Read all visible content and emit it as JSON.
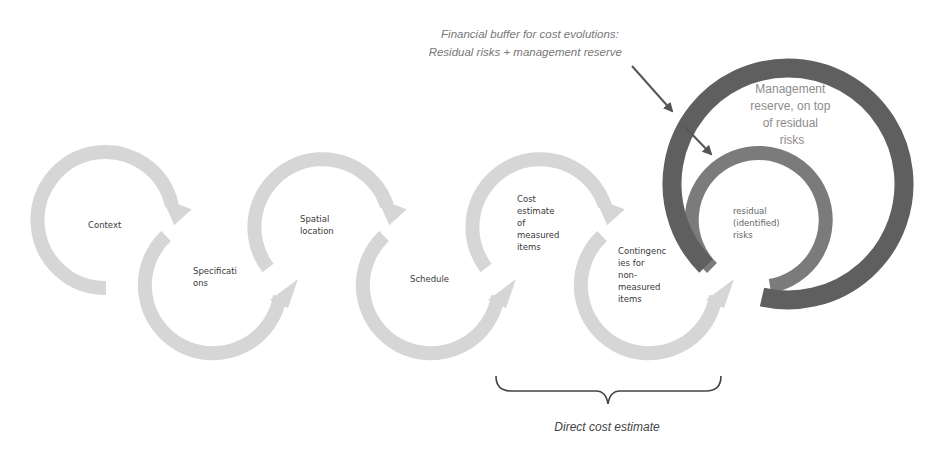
{
  "annotation": {
    "line1": "Financial buffer for cost evolutions:",
    "line2": "Residual risks + management reserve"
  },
  "steps": [
    {
      "lines": [
        "Context"
      ]
    },
    {
      "lines": [
        "Specificati",
        "ons"
      ]
    },
    {
      "lines": [
        "Spatial",
        "location"
      ]
    },
    {
      "lines": [
        "Schedule"
      ]
    },
    {
      "lines": [
        "Cost",
        "estimate",
        "of",
        "measured",
        "items"
      ]
    },
    {
      "lines": [
        "Contingenc",
        "ies for",
        "non-",
        "measured",
        "items"
      ]
    }
  ],
  "residual": {
    "lines": [
      "residual",
      "(identified)",
      "risks"
    ]
  },
  "reserve": {
    "lines": [
      "Management",
      "reserve, on top",
      "of residual",
      "risks"
    ]
  },
  "brace_caption": "Direct cost estimate",
  "colors": {
    "step_arrow": "#d6d6d6",
    "reserve_ring": "#5f5f5f",
    "residual_ring": "#7b7b7b",
    "pointer": "#555555"
  }
}
